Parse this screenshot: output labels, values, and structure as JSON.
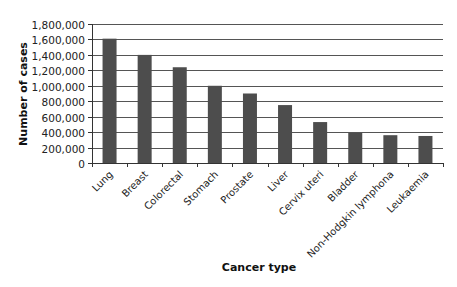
{
  "chart_data": {
    "type": "bar",
    "title": "",
    "xlabel": "Cancer type",
    "ylabel": "Number of cases",
    "categories": [
      "Lung",
      "Breast",
      "Colorectal",
      "Stomach",
      "Prostate",
      "Liver",
      "Cervix uteri",
      "Bladder",
      "Non-Hodgkin lymphona",
      "Leukaemia"
    ],
    "values": [
      1610000,
      1400000,
      1240000,
      1000000,
      900000,
      750000,
      530000,
      390000,
      360000,
      350000
    ],
    "ylim": [
      0,
      1800000
    ],
    "yticks": [
      0,
      200000,
      400000,
      600000,
      800000,
      1000000,
      1200000,
      1400000,
      1600000,
      1800000
    ],
    "ytick_labels": [
      "0",
      "200,000",
      "400,000",
      "600,000",
      "800,000",
      "1,000,000",
      "1,200,000",
      "1,400,000",
      "1,600,000",
      "1,800,000"
    ],
    "grid": true,
    "legend": null,
    "bar_color": "#4d4d4d",
    "grid_color": "#555555"
  }
}
